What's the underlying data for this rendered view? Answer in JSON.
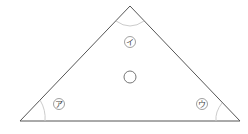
{
  "diagram": {
    "type": "triangle",
    "vertices": {
      "apex": [
        130,
        6
      ],
      "left": [
        20,
        121
      ],
      "right": [
        240,
        121
      ]
    },
    "angle_labels": [
      {
        "id": "a",
        "text": "ア",
        "x": 55,
        "y": 104
      },
      {
        "id": "i",
        "text": "イ",
        "x": 130,
        "y": 42
      },
      {
        "id": "u",
        "text": "ウ",
        "x": 200,
        "y": 104
      }
    ],
    "center_marker": {
      "x": 130,
      "y": 77,
      "r": 6
    },
    "colors": {
      "stroke": "#555555",
      "arc": "#cccccc",
      "label_circle": "#888888"
    }
  }
}
